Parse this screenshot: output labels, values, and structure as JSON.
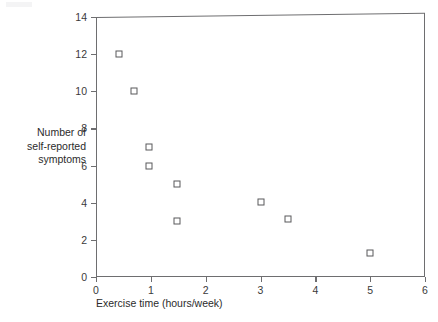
{
  "chart_data": {
    "type": "scatter",
    "title": "",
    "xlabel": "Exercise time (hours/week)",
    "ylabel": "Number of self-reported symptoms",
    "ylabel_lines": [
      "Number of",
      "self-reported",
      "symptoms"
    ],
    "xlim": [
      0,
      6
    ],
    "ylim": [
      0,
      14
    ],
    "xticks": [
      0,
      1,
      2,
      3,
      4,
      5,
      6
    ],
    "xtick_labels": [
      "0",
      "1",
      "2",
      "3",
      "4",
      "5",
      "6"
    ],
    "yticks": [
      0,
      2,
      4,
      6,
      8,
      10,
      12,
      14
    ],
    "ytick_labels": [
      "0",
      "2",
      "4",
      "6",
      "8",
      "10",
      "12",
      "14"
    ],
    "grid": false,
    "legend": null,
    "marker": "open-square",
    "marker_color": "#58585b",
    "points": [
      {
        "x": 0.42,
        "y": 12.0
      },
      {
        "x": 0.7,
        "y": 10.0
      },
      {
        "x": 0.97,
        "y": 7.0
      },
      {
        "x": 0.97,
        "y": 6.0
      },
      {
        "x": 1.48,
        "y": 5.0
      },
      {
        "x": 1.48,
        "y": 3.0
      },
      {
        "x": 3.0,
        "y": 4.05
      },
      {
        "x": 3.5,
        "y": 3.15
      },
      {
        "x": 5.0,
        "y": 1.3
      }
    ]
  },
  "axis_color": "#6e6e70",
  "text_color": "#2b2b2b",
  "background": "#ffffff"
}
